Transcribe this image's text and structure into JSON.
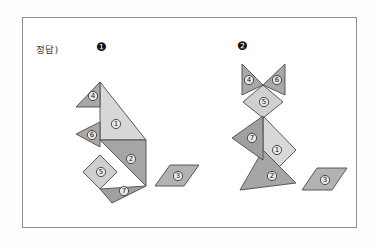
{
  "page": {
    "background": "#ffffff",
    "frame_color": "#8d8d8d"
  },
  "header": {
    "answer_label": "정답)",
    "figure_markers": [
      {
        "name": "figure-1-marker",
        "glyph": "❶"
      },
      {
        "name": "figure-2-marker",
        "glyph": "❷"
      }
    ]
  },
  "colors": {
    "piece_light": "#d5d5d5",
    "piece_medium": "#a8a8a8",
    "piece_dark": "#9a9a9a",
    "outline": "#4a4a4a",
    "label_text": "#111111"
  },
  "figures": [
    {
      "id": "figure-1",
      "marker": "❶",
      "name": "tangram-rabbit",
      "pieces": [
        {
          "label": "①",
          "piece": "large-triangle",
          "fill": "#d8d8d8",
          "points": "100,140 100,82 146,140",
          "lx": 116,
          "ly": 124
        },
        {
          "label": "②",
          "piece": "large-triangle",
          "fill": "#a6a6a6",
          "points": "100,140 146,140 146,186 ",
          "lx": 131,
          "ly": 159
        },
        {
          "label": "③",
          "piece": "parallelogram",
          "fill": "#b2b2b2",
          "points": "155,186 170,165 199,165 184,186",
          "lx": 178,
          "ly": 176
        },
        {
          "label": "④",
          "piece": "small-triangle",
          "fill": "#a8a8a8",
          "points": "100,82 100,107 76,107",
          "lx": 93,
          "ly": 96
        },
        {
          "label": "⑤",
          "piece": "square",
          "fill": "#cfcfcf",
          "points": "100,155 117,172 100,189 83,172",
          "lx": 101,
          "ly": 172
        },
        {
          "label": "⑥",
          "piece": "small-triangle",
          "fill": "#a8a8a8",
          "points": "100,122 100,147 76,134",
          "lx": 92,
          "ly": 135
        },
        {
          "label": "⑦",
          "piece": "medium-triangle",
          "fill": "#a0a0a0",
          "points": "100,189 146,186 112,203",
          "lx": 124,
          "ly": 191
        }
      ]
    },
    {
      "id": "figure-2",
      "marker": "❷",
      "name": "tangram-cat",
      "pieces": [
        {
          "label": "①",
          "piece": "large-triangle",
          "fill": "#d8d8d8",
          "points": "263,116 296,150 263,183",
          "lx": 277,
          "ly": 150
        },
        {
          "label": "②",
          "piece": "large-triangle",
          "fill": "#a6a6a6",
          "points": "263,150 296,183 240,190",
          "lx": 272,
          "ly": 176
        },
        {
          "label": "③",
          "piece": "parallelogram",
          "fill": "#b2b2b2",
          "points": "302,190 317,168 347,168 332,190",
          "lx": 325,
          "ly": 180
        },
        {
          "label": "④",
          "piece": "small-triangle",
          "fill": "#a8a8a8",
          "points": "242,64 263,85 242,95",
          "lx": 249,
          "ly": 80
        },
        {
          "label": "⑤",
          "piece": "square",
          "fill": "#d0d0d0",
          "points": "263,85 283,102 263,118 243,102",
          "lx": 264,
          "ly": 102
        },
        {
          "label": "⑥",
          "piece": "small-triangle",
          "fill": "#a8a8a8",
          "points": "285,64 285,95 263,85",
          "lx": 277,
          "ly": 80
        },
        {
          "label": "⑦",
          "piece": "medium-triangle",
          "fill": "#a0a0a0",
          "points": "263,116 263,160 232,138",
          "lx": 252,
          "ly": 138
        }
      ]
    }
  ]
}
